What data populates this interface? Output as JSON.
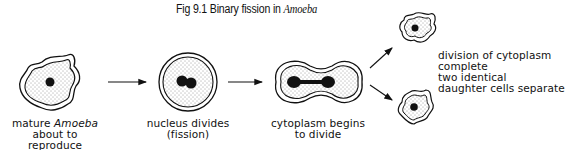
{
  "figure": {
    "title_prefix": "Fig 9.1  Binary fission in ",
    "title_italic": "Amoeba"
  },
  "stages": [
    {
      "label_line1_pre": "mature ",
      "label_line1_italic": "Amoeba",
      "label_line2": "about to reproduce"
    },
    {
      "label_line1": "nucleus divides",
      "label_line2": "(fission)"
    },
    {
      "label_line1": "cytoplasm begins",
      "label_line2": "to divide"
    },
    {
      "label_lines": [
        "division of cytoplasm",
        "complete",
        "two identical",
        "daughter cells separate"
      ]
    }
  ],
  "colors": {
    "ink": "#111111",
    "background": "#ffffff"
  }
}
